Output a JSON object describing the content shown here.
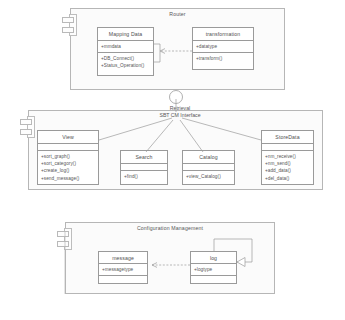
{
  "diagram": {
    "caption": "",
    "colors": {
      "frame_border": "#b6b6b6",
      "frame_fill": "#fbfbfb",
      "class_border": "#9a9a9a",
      "class_fill": "#ffffff",
      "text": "#555555",
      "connector": "#9b9b9b"
    }
  },
  "components": [
    {
      "name": "router",
      "title": "Router",
      "classes": [
        {
          "name": "mapping-data",
          "title": "Mapping Data",
          "attributes": [
            "+mmdata"
          ],
          "operations": [
            "+DB_Connect()",
            "+Status_Operation()"
          ]
        },
        {
          "name": "transformation",
          "title": "transformation",
          "attributes": [
            "+datatype"
          ],
          "operations": [
            "+transform()"
          ]
        }
      ]
    },
    {
      "name": "retrieval",
      "title": "Retrieval",
      "interface_label": "SBT CM Interface",
      "classes": [
        {
          "name": "view",
          "title": "View",
          "attributes": [],
          "operations": [
            "+sort_graph()",
            "+sort_category()",
            "+create_log()",
            "+send_message()"
          ]
        },
        {
          "name": "search",
          "title": "Search",
          "attributes": [],
          "operations": [
            "+find()"
          ]
        },
        {
          "name": "catalog",
          "title": "Catalog",
          "attributes": [],
          "operations": [
            "+view_Catalog()"
          ]
        },
        {
          "name": "store-data",
          "title": "StoreData",
          "attributes": [],
          "operations": [
            "+nm_receive()",
            "+nm_send()",
            "+add_data()",
            "+del_data()"
          ]
        }
      ]
    },
    {
      "name": "configuration-management",
      "title": "Configuration Management",
      "classes": [
        {
          "name": "message",
          "title": "message",
          "attributes": [
            "+messagetype"
          ],
          "operations": []
        },
        {
          "name": "log",
          "title": "log",
          "attributes": [
            "+logtype"
          ],
          "operations": []
        }
      ]
    }
  ]
}
